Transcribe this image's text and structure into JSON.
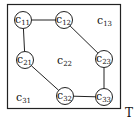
{
  "diagram": {
    "frame_label": "T",
    "nodes": [
      {
        "id": "c11",
        "base": "c",
        "sub": "11",
        "x": 23,
        "y": 20,
        "circled": true
      },
      {
        "id": "c12",
        "base": "c",
        "sub": "12",
        "x": 64,
        "y": 20,
        "circled": true
      },
      {
        "id": "c13",
        "base": "c",
        "sub": "13",
        "x": 105,
        "y": 21,
        "circled": false
      },
      {
        "id": "c21",
        "base": "c",
        "sub": "21",
        "x": 25,
        "y": 60,
        "circled": true
      },
      {
        "id": "c22",
        "base": "c",
        "sub": "22",
        "x": 65,
        "y": 61,
        "circled": false
      },
      {
        "id": "c23",
        "base": "c",
        "sub": "23",
        "x": 104,
        "y": 59,
        "circled": true
      },
      {
        "id": "c31",
        "base": "c",
        "sub": "31",
        "x": 24,
        "y": 98,
        "circled": false
      },
      {
        "id": "c32",
        "base": "c",
        "sub": "32",
        "x": 65,
        "y": 96,
        "circled": true
      },
      {
        "id": "c33",
        "base": "c",
        "sub": "33",
        "x": 104,
        "y": 97,
        "circled": true
      }
    ],
    "edges": [
      [
        "c11",
        "c12"
      ],
      [
        "c12",
        "c23"
      ],
      [
        "c23",
        "c33"
      ],
      [
        "c33",
        "c32"
      ],
      [
        "c32",
        "c21"
      ],
      [
        "c21",
        "c11"
      ]
    ]
  }
}
